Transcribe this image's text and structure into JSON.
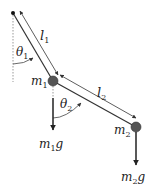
{
  "diagram": {
    "colors": {
      "line": "#333333",
      "mass": "#555555",
      "dotted": "#999999",
      "background": "#ffffff"
    },
    "pivot": {
      "x": 13,
      "y": 13
    },
    "masses": [
      {
        "id": "m1",
        "x": 53,
        "y": 81,
        "r": 5,
        "label": "m",
        "sub": "1"
      },
      {
        "id": "m2",
        "x": 136,
        "y": 127,
        "r": 5,
        "label": "m",
        "sub": "2"
      }
    ],
    "lengths": [
      {
        "id": "l1",
        "label": "l",
        "sub": "1"
      },
      {
        "id": "l2",
        "label": "l",
        "sub": "2"
      }
    ],
    "angles": [
      {
        "id": "theta1",
        "label": "θ",
        "sub": "1"
      },
      {
        "id": "theta2",
        "label": "θ",
        "sub": "2"
      }
    ],
    "forces": [
      {
        "id": "m1g",
        "label": "m",
        "sub": "1",
        "suffix": "g"
      },
      {
        "id": "m2g",
        "label": "m",
        "sub": "2",
        "suffix": "g"
      }
    ]
  }
}
